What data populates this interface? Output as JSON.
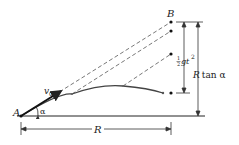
{
  "diagram": {
    "type": "projectile-motion",
    "labels": {
      "point_a": "A",
      "point_b": "B",
      "velocity": "v",
      "velocity_sub": "0",
      "angle": "α",
      "range": "R",
      "height": "R tan α",
      "drop_half": "1",
      "drop_den": "2",
      "drop_expr": "gt",
      "drop_exp": "2"
    },
    "colors": {
      "line": "#222222",
      "trajectory": "#444444",
      "dash": "#555555",
      "background": "#ffffff"
    },
    "points": {
      "A": [
        21,
        116
      ],
      "B": [
        171,
        22
      ],
      "dots": [
        [
          171,
          22
        ],
        [
          171,
          31
        ],
        [
          171,
          54
        ],
        [
          171,
          93
        ]
      ]
    }
  }
}
